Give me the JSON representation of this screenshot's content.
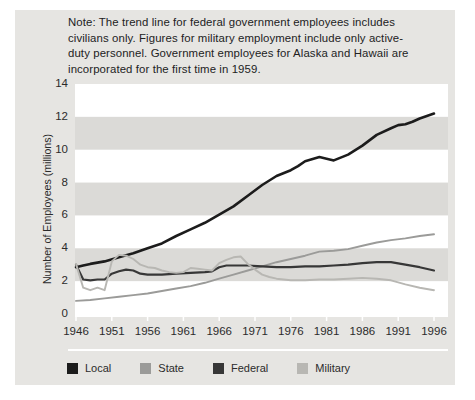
{
  "note": "Note: The trend line for federal government employees includes civilians only. Figures for military employment include only active-duty personnel. Government employees for Alaska and Hawaii are incorporated for the first time in 1959.",
  "colors": {
    "panel_bg": "#e6e5e2",
    "plot_bg": "#ffffff",
    "band": "#dbdad7",
    "text": "#2b2b2b",
    "divider": "#ffffff",
    "tick": "#ffffff"
  },
  "chart_data": {
    "type": "line",
    "title": "",
    "xlabel": "",
    "ylabel": "Number of Employees (millions)",
    "xlim": [
      1946,
      1996
    ],
    "ylim": [
      0,
      14
    ],
    "x_ticks": [
      1946,
      1951,
      1956,
      1961,
      1966,
      1971,
      1976,
      1981,
      1986,
      1991,
      1996
    ],
    "y_ticks": [
      0,
      2,
      4,
      6,
      8,
      10,
      12,
      14
    ],
    "grid": "striped-horizontal-bands",
    "band_pairs": [
      [
        2,
        4
      ],
      [
        6,
        8
      ],
      [
        10,
        12
      ]
    ],
    "legend_position": "bottom",
    "series": [
      {
        "name": "Local",
        "color": "#1c1c1c",
        "width": 2.6,
        "points": [
          [
            1946,
            2.85
          ],
          [
            1947,
            2.95
          ],
          [
            1948,
            3.05
          ],
          [
            1950,
            3.2
          ],
          [
            1952,
            3.45
          ],
          [
            1954,
            3.7
          ],
          [
            1956,
            4.0
          ],
          [
            1958,
            4.3
          ],
          [
            1960,
            4.75
          ],
          [
            1962,
            5.15
          ],
          [
            1964,
            5.55
          ],
          [
            1966,
            6.05
          ],
          [
            1968,
            6.55
          ],
          [
            1970,
            7.2
          ],
          [
            1972,
            7.85
          ],
          [
            1974,
            8.4
          ],
          [
            1976,
            8.75
          ],
          [
            1977,
            9.0
          ],
          [
            1978,
            9.3
          ],
          [
            1980,
            9.55
          ],
          [
            1981,
            9.45
          ],
          [
            1982,
            9.35
          ],
          [
            1984,
            9.7
          ],
          [
            1986,
            10.25
          ],
          [
            1988,
            10.9
          ],
          [
            1990,
            11.3
          ],
          [
            1991,
            11.5
          ],
          [
            1992,
            11.55
          ],
          [
            1993,
            11.7
          ],
          [
            1994,
            11.9
          ],
          [
            1996,
            12.2
          ]
        ]
      },
      {
        "name": "State",
        "color": "#9b9b99",
        "width": 1.9,
        "points": [
          [
            1946,
            0.8
          ],
          [
            1948,
            0.85
          ],
          [
            1950,
            0.95
          ],
          [
            1952,
            1.05
          ],
          [
            1954,
            1.15
          ],
          [
            1956,
            1.25
          ],
          [
            1958,
            1.4
          ],
          [
            1960,
            1.55
          ],
          [
            1962,
            1.7
          ],
          [
            1964,
            1.9
          ],
          [
            1966,
            2.15
          ],
          [
            1968,
            2.4
          ],
          [
            1970,
            2.65
          ],
          [
            1972,
            2.9
          ],
          [
            1974,
            3.15
          ],
          [
            1976,
            3.35
          ],
          [
            1978,
            3.55
          ],
          [
            1980,
            3.8
          ],
          [
            1982,
            3.85
          ],
          [
            1984,
            3.95
          ],
          [
            1986,
            4.15
          ],
          [
            1988,
            4.35
          ],
          [
            1990,
            4.5
          ],
          [
            1992,
            4.6
          ],
          [
            1994,
            4.75
          ],
          [
            1996,
            4.85
          ]
        ]
      },
      {
        "name": "Federal",
        "color": "#373737",
        "width": 2.2,
        "points": [
          [
            1946,
            3.0
          ],
          [
            1947,
            2.1
          ],
          [
            1948,
            2.05
          ],
          [
            1949,
            2.1
          ],
          [
            1950,
            2.1
          ],
          [
            1951,
            2.45
          ],
          [
            1952,
            2.6
          ],
          [
            1953,
            2.7
          ],
          [
            1954,
            2.65
          ],
          [
            1955,
            2.45
          ],
          [
            1956,
            2.4
          ],
          [
            1958,
            2.4
          ],
          [
            1960,
            2.45
          ],
          [
            1962,
            2.5
          ],
          [
            1964,
            2.55
          ],
          [
            1965,
            2.6
          ],
          [
            1966,
            2.85
          ],
          [
            1967,
            2.95
          ],
          [
            1968,
            2.95
          ],
          [
            1970,
            2.95
          ],
          [
            1972,
            2.9
          ],
          [
            1974,
            2.85
          ],
          [
            1976,
            2.85
          ],
          [
            1978,
            2.9
          ],
          [
            1980,
            2.9
          ],
          [
            1982,
            2.95
          ],
          [
            1984,
            3.0
          ],
          [
            1986,
            3.1
          ],
          [
            1988,
            3.15
          ],
          [
            1990,
            3.15
          ],
          [
            1992,
            3.0
          ],
          [
            1994,
            2.85
          ],
          [
            1996,
            2.65
          ]
        ]
      },
      {
        "name": "Military",
        "color": "#b8b7b3",
        "width": 1.9,
        "points": [
          [
            1946,
            3.05
          ],
          [
            1947,
            1.6
          ],
          [
            1948,
            1.45
          ],
          [
            1949,
            1.6
          ],
          [
            1950,
            1.45
          ],
          [
            1951,
            3.2
          ],
          [
            1952,
            3.6
          ],
          [
            1953,
            3.55
          ],
          [
            1954,
            3.35
          ],
          [
            1955,
            3.0
          ],
          [
            1956,
            2.85
          ],
          [
            1957,
            2.8
          ],
          [
            1958,
            2.65
          ],
          [
            1959,
            2.55
          ],
          [
            1960,
            2.5
          ],
          [
            1961,
            2.55
          ],
          [
            1962,
            2.8
          ],
          [
            1963,
            2.75
          ],
          [
            1964,
            2.7
          ],
          [
            1965,
            2.65
          ],
          [
            1966,
            3.1
          ],
          [
            1967,
            3.3
          ],
          [
            1968,
            3.45
          ],
          [
            1969,
            3.5
          ],
          [
            1970,
            3.05
          ],
          [
            1971,
            2.7
          ],
          [
            1972,
            2.4
          ],
          [
            1973,
            2.25
          ],
          [
            1974,
            2.15
          ],
          [
            1976,
            2.05
          ],
          [
            1978,
            2.05
          ],
          [
            1980,
            2.1
          ],
          [
            1982,
            2.1
          ],
          [
            1984,
            2.15
          ],
          [
            1986,
            2.2
          ],
          [
            1988,
            2.15
          ],
          [
            1990,
            2.05
          ],
          [
            1992,
            1.8
          ],
          [
            1994,
            1.6
          ],
          [
            1996,
            1.45
          ]
        ]
      }
    ]
  }
}
